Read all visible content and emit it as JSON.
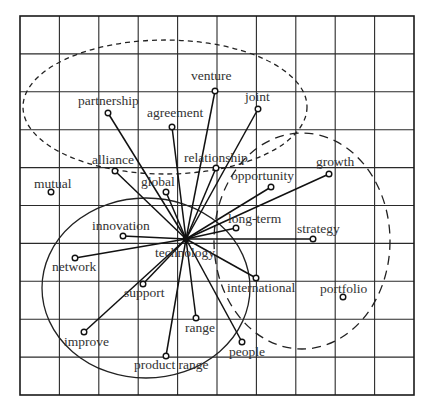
{
  "diagram": {
    "type": "word-association-network",
    "canvas": {
      "width": 434,
      "height": 414
    },
    "grid": {
      "x0": 20,
      "y0": 16,
      "x1": 414,
      "y1": 395,
      "columns": 10,
      "rows": 10
    },
    "hub": {
      "label": "technology",
      "x": 186,
      "y": 239,
      "label_x": 155,
      "label_y": 257
    },
    "nodes": [
      {
        "id": "venture",
        "label": "venture",
        "x": 215,
        "y": 91,
        "lx": 191,
        "ly": 80,
        "connected": true
      },
      {
        "id": "joint",
        "label": "joint",
        "x": 258,
        "y": 109,
        "lx": 245,
        "ly": 101,
        "connected": true
      },
      {
        "id": "partnership",
        "label": "partnership",
        "x": 108,
        "y": 113,
        "lx": 78,
        "ly": 105,
        "connected": true
      },
      {
        "id": "agreement",
        "label": "agreement",
        "x": 172,
        "y": 127,
        "lx": 147,
        "ly": 117,
        "connected": true
      },
      {
        "id": "alliance",
        "label": "alliance",
        "x": 115,
        "y": 171,
        "lx": 92,
        "ly": 164,
        "connected": true
      },
      {
        "id": "relationship",
        "label": "relationship",
        "x": 216,
        "y": 168,
        "lx": 184,
        "ly": 162,
        "connected": true
      },
      {
        "id": "global",
        "label": "global",
        "x": 166,
        "y": 192,
        "lx": 141,
        "ly": 186,
        "connected": true
      },
      {
        "id": "mutual",
        "label": "mutual",
        "x": 51,
        "y": 192,
        "lx": 34,
        "ly": 188,
        "connected": false
      },
      {
        "id": "opportunity",
        "label": "opportunity",
        "x": 271,
        "y": 187,
        "lx": 231,
        "ly": 180,
        "connected": true
      },
      {
        "id": "growth",
        "label": "growth",
        "x": 329,
        "y": 174,
        "lx": 316,
        "ly": 166,
        "connected": true
      },
      {
        "id": "innovation",
        "label": "innovation",
        "x": 123,
        "y": 236,
        "lx": 92,
        "ly": 230,
        "connected": true
      },
      {
        "id": "long-term",
        "label": "long-term",
        "x": 236,
        "y": 228,
        "lx": 228,
        "ly": 223,
        "connected": true
      },
      {
        "id": "strategy",
        "label": "strategy",
        "x": 313,
        "y": 239,
        "lx": 297,
        "ly": 233,
        "connected": true
      },
      {
        "id": "network",
        "label": "network",
        "x": 75,
        "y": 258,
        "lx": 52,
        "ly": 271,
        "connected": true
      },
      {
        "id": "support",
        "label": "support",
        "x": 143,
        "y": 284,
        "lx": 124,
        "ly": 297,
        "connected": true
      },
      {
        "id": "international",
        "label": "international",
        "x": 256,
        "y": 278,
        "lx": 227,
        "ly": 292,
        "connected": true
      },
      {
        "id": "portfolio",
        "label": "portfolio",
        "x": 343,
        "y": 297,
        "lx": 320,
        "ly": 293,
        "connected": false
      },
      {
        "id": "range",
        "label": "range",
        "x": 196,
        "y": 318,
        "lx": 185,
        "ly": 332,
        "connected": true
      },
      {
        "id": "improve",
        "label": "improve",
        "x": 84,
        "y": 332,
        "lx": 64,
        "ly": 346,
        "connected": true
      },
      {
        "id": "people",
        "label": "people",
        "x": 242,
        "y": 342,
        "lx": 229,
        "ly": 356,
        "connected": true
      },
      {
        "id": "product-range",
        "label": "product range",
        "x": 166,
        "y": 356,
        "lx": 134,
        "ly": 369,
        "connected": true
      }
    ],
    "clusters": [
      {
        "name": "partnership-cluster",
        "shape": "ellipse",
        "style": "short-dash",
        "cx": 165,
        "cy": 107,
        "rx": 142,
        "ry": 67
      },
      {
        "name": "growth-cluster",
        "shape": "ellipse",
        "style": "long-dash",
        "cx": 302,
        "cy": 241,
        "rx": 88,
        "ry": 108
      },
      {
        "name": "technology-cluster",
        "shape": "ellipse",
        "style": "solid",
        "cx": 146,
        "cy": 288,
        "rx": 104,
        "ry": 90
      }
    ],
    "colors": {
      "line": "#111111",
      "grid": "#2a2a2a",
      "text": "#333333",
      "background": "#ffffff"
    }
  }
}
